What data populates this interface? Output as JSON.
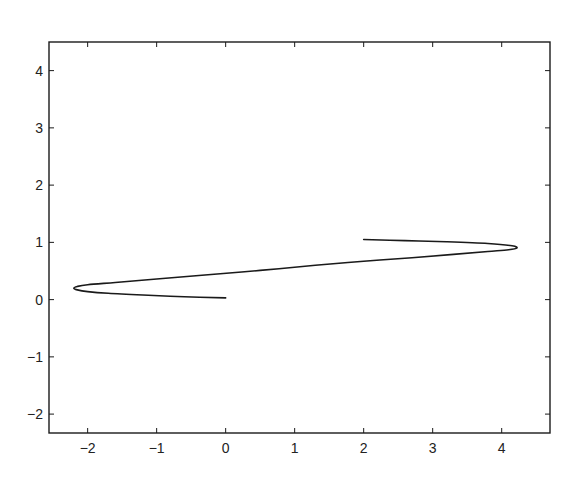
{
  "chart_data": {
    "type": "line",
    "title": "",
    "xlabel": "",
    "ylabel": "",
    "xlim": [
      -2.56,
      4.7
    ],
    "ylim": [
      -2.33,
      4.5
    ],
    "grid": false,
    "legend": null,
    "x_ticks": [
      -2,
      -1,
      0,
      1,
      2,
      3,
      4
    ],
    "x_tick_labels": [
      "−2",
      "−1",
      "0",
      "1",
      "2",
      "3",
      "4"
    ],
    "y_ticks": [
      -2,
      -1,
      0,
      1,
      2,
      3,
      4
    ],
    "y_tick_labels": [
      "−2",
      "−1",
      "0",
      "1",
      "2",
      "3",
      "4"
    ],
    "series": [
      {
        "name": "curve",
        "color": "#1a1a1a",
        "points": [
          [
            0.0,
            0.03
          ],
          [
            -0.6,
            0.05
          ],
          [
            -1.2,
            0.08
          ],
          [
            -1.7,
            0.11
          ],
          [
            -2.0,
            0.14
          ],
          [
            -2.15,
            0.17
          ],
          [
            -2.2,
            0.2
          ],
          [
            -2.15,
            0.23
          ],
          [
            -2.0,
            0.26
          ],
          [
            -1.6,
            0.3
          ],
          [
            -1.0,
            0.36
          ],
          [
            -0.3,
            0.43
          ],
          [
            0.5,
            0.51
          ],
          [
            1.3,
            0.6
          ],
          [
            2.0,
            0.67
          ],
          [
            2.7,
            0.73
          ],
          [
            3.3,
            0.79
          ],
          [
            3.8,
            0.84
          ],
          [
            4.1,
            0.87
          ],
          [
            4.22,
            0.9
          ],
          [
            4.15,
            0.94
          ],
          [
            3.8,
            0.98
          ],
          [
            3.2,
            1.01
          ],
          [
            2.6,
            1.03
          ],
          [
            2.0,
            1.05
          ]
        ]
      }
    ]
  },
  "colors": {
    "background": "#ffffff",
    "axes": "#1a1a1a",
    "curve": "#1a1a1a"
  }
}
